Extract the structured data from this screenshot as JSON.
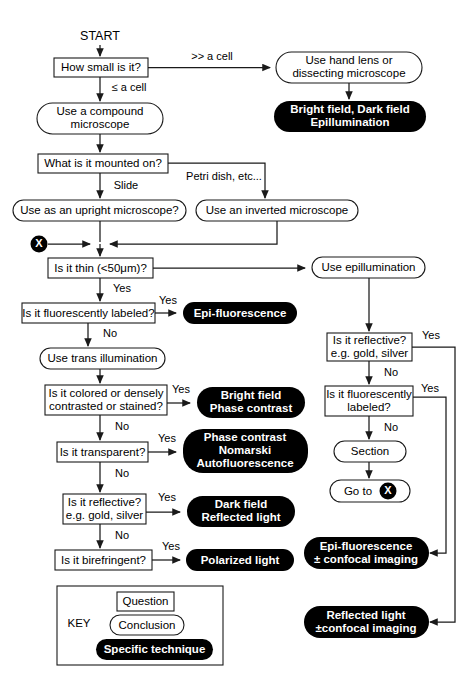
{
  "start": {
    "label": "START"
  },
  "nodes": {
    "how_small": {
      "label": "How small is it?",
      "kind": "question"
    },
    "hand_lens": {
      "line1": "Use hand lens or",
      "line2": "dissecting microscope",
      "kind": "conclusion"
    },
    "bright_dark_epi": {
      "line1": "Bright field,  Dark field",
      "line2": "Epillumination",
      "kind": "technique"
    },
    "compound": {
      "line1": "Use a compound",
      "line2": "microscope",
      "kind": "conclusion"
    },
    "mounted_on": {
      "label": "What is it mounted on?",
      "kind": "question"
    },
    "upright": {
      "label": "Use as an upright microscope?",
      "kind": "conclusion"
    },
    "inverted": {
      "label": "Use an inverted microscope",
      "kind": "conclusion"
    },
    "is_thin": {
      "label": "Is it thin (<50μm)?",
      "kind": "question"
    },
    "use_epi": {
      "label": "Use epillumination",
      "kind": "conclusion"
    },
    "fluor_labeled_left": {
      "label": "Is it fluorescently labeled?",
      "kind": "question"
    },
    "epi_fluorescence": {
      "label": "Epi-fluorescence",
      "kind": "technique"
    },
    "trans_illum": {
      "label": "Use trans illumination",
      "kind": "conclusion"
    },
    "colored_dense": {
      "line1": "Is it colored or densely",
      "line2": "contrasted or stained?",
      "kind": "question"
    },
    "bright_phase": {
      "line1": "Bright field",
      "line2": "Phase contrast",
      "kind": "technique"
    },
    "transparent": {
      "label": "Is it transparent?",
      "kind": "question"
    },
    "phase_nomarski": {
      "line1": "Phase contrast",
      "line2": "Nomarski",
      "line3": "Autofluorescence",
      "kind": "technique"
    },
    "reflective_left": {
      "line1": "Is it reflective?",
      "line2": "e.g. gold, silver",
      "kind": "question"
    },
    "dark_reflected": {
      "line1": "Dark field",
      "line2": "Reflected light",
      "kind": "technique"
    },
    "birefringent": {
      "label": "Is it birefringent?",
      "kind": "question"
    },
    "polarized": {
      "label": "Polarized light",
      "kind": "technique"
    },
    "reflective_right": {
      "line1": "Is it reflective?",
      "line2": "e.g. gold, silver",
      "kind": "question"
    },
    "fluor_labeled_right": {
      "line1": "Is it fluorescently",
      "line2": "labeled?",
      "kind": "question"
    },
    "section": {
      "label": "Section",
      "kind": "conclusion"
    },
    "goto_x": {
      "label": "Go to",
      "marker": "X",
      "kind": "conclusion"
    },
    "epi_confocal": {
      "line1": "Epi-fluorescence",
      "line2": "± confocal imaging",
      "kind": "technique"
    },
    "reflected_confocal": {
      "line1": "Reflected light",
      "line2": "±confocal imaging",
      "kind": "technique"
    }
  },
  "edge_labels": {
    "much_bigger_than_cell": ">> a cell",
    "le_a_cell": "≤ a cell",
    "slide": "Slide",
    "petri_dish": "Petri dish, etc...",
    "yes_thin": "Yes",
    "yes_fluor_left": "Yes",
    "no_fluor_left": "No",
    "yes_colored": "Yes",
    "no_colored": "No",
    "yes_transparent": "Yes",
    "no_transparent": "No",
    "yes_reflective_left": "Yes",
    "no_reflective_left": "No",
    "yes_birefringent": "Yes",
    "yes_reflective_right": "Yes",
    "no_reflective_right": "No",
    "yes_fluor_right": "Yes",
    "no_fluor_right": "No"
  },
  "key": {
    "title": "KEY",
    "question_label": "Question",
    "conclusion_label": "Conclusion",
    "technique_label": "Specific technique"
  },
  "marker": {
    "x_glyph": "X"
  },
  "colors": {
    "background": "#ffffff",
    "stroke": "#1a1a1a",
    "technique_fill": "#000000",
    "technique_text": "#ffffff",
    "text": "#000000"
  }
}
